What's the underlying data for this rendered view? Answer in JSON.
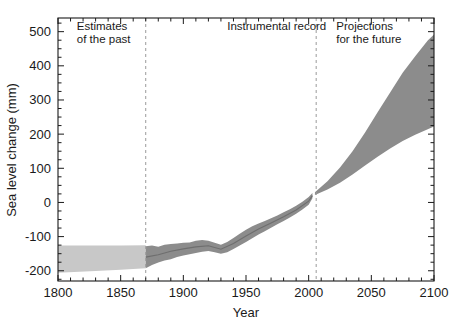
{
  "chart_data": {
    "type": "area",
    "title": "",
    "xlabel": "Year",
    "ylabel": "Sea level change (mm)",
    "xlim": [
      1800,
      2100
    ],
    "ylim": [
      -230,
      540
    ],
    "grid": false,
    "legend_position": "none",
    "xticks": [
      1800,
      1850,
      1900,
      1950,
      2000,
      2050,
      2100
    ],
    "xtick_labels": [
      "1800",
      "1850",
      "1900",
      "1950",
      "2000",
      "2050",
      "2100"
    ],
    "xminor_step": 10,
    "yticks": [
      -200,
      -100,
      0,
      100,
      200,
      300,
      400,
      500
    ],
    "ytick_labels": [
      "-200",
      "-100",
      "0",
      "100",
      "200",
      "300",
      "400",
      "500"
    ],
    "yminor_step": 25,
    "annotations": [
      {
        "name": "estimates-of-the-past",
        "lines": [
          "Estimates",
          "of the past"
        ],
        "x": 1815,
        "y": 505
      },
      {
        "name": "instrumental-record",
        "lines": [
          "Instrumental record"
        ],
        "x": 1935,
        "y": 505
      },
      {
        "name": "projections-for-the-future",
        "lines": [
          "Projections",
          "for the future"
        ],
        "x": 2022,
        "y": 505
      }
    ],
    "dividers": [
      {
        "name": "paleo-instrumental-divider",
        "x": 1870
      },
      {
        "name": "instrumental-projection-divider",
        "x": 2006
      }
    ],
    "series": [
      {
        "name": "Estimates of the past (proxy range)",
        "kind": "band",
        "color": "#c8c8c8",
        "x": [
          1800,
          1830,
          1850,
          1870
        ],
        "upper": [
          -126,
          -126,
          -126,
          -125
        ],
        "lower": [
          -206,
          -201,
          -197,
          -193
        ]
      },
      {
        "name": "Instrumental record (tide gauge range)",
        "kind": "band",
        "color": "#8c8c8c",
        "x": [
          1870,
          1875,
          1880,
          1885,
          1890,
          1895,
          1900,
          1905,
          1910,
          1915,
          1920,
          1925,
          1930,
          1935,
          1940,
          1945,
          1950,
          1955,
          1960,
          1965,
          1970,
          1975,
          1980,
          1985,
          1990,
          1995,
          2000,
          2003
        ],
        "upper": [
          -128,
          -126,
          -130,
          -124,
          -122,
          -120,
          -118,
          -117,
          -112,
          -110,
          -112,
          -118,
          -124,
          -116,
          -104,
          -92,
          -80,
          -70,
          -62,
          -54,
          -46,
          -38,
          -29,
          -20,
          -10,
          2,
          16,
          28
        ],
        "lower": [
          -193,
          -183,
          -176,
          -170,
          -166,
          -160,
          -155,
          -152,
          -148,
          -144,
          -142,
          -146,
          -150,
          -146,
          -136,
          -126,
          -116,
          -105,
          -94,
          -84,
          -74,
          -64,
          -54,
          -44,
          -33,
          -21,
          -7,
          12
        ]
      },
      {
        "name": "Instrumental record central estimate",
        "kind": "line",
        "color": "#6e6e6e",
        "x": [
          1870,
          1880,
          1890,
          1900,
          1910,
          1920,
          1930,
          1940,
          1950,
          1960,
          1970,
          1980,
          1990,
          2000,
          2003
        ],
        "y": [
          -160,
          -153,
          -143,
          -136,
          -130,
          -127,
          -137,
          -120,
          -98,
          -78,
          -60,
          -42,
          -22,
          4,
          20
        ]
      },
      {
        "name": "Projections for the future (scenario range)",
        "kind": "band",
        "color": "#8c8c8c",
        "x": [
          2005,
          2015,
          2025,
          2035,
          2045,
          2055,
          2065,
          2075,
          2085,
          2095,
          2100
        ],
        "upper": [
          30,
          62,
          102,
          150,
          205,
          264,
          322,
          380,
          428,
          474,
          492
        ],
        "lower": [
          22,
          38,
          58,
          82,
          108,
          134,
          158,
          180,
          198,
          214,
          222
        ]
      }
    ]
  },
  "figure": {
    "background_color": "#ffffff",
    "axis_color": "#1a1a1a",
    "divider_color": "#9a9a9a",
    "band_light_color": "#c8c8c8",
    "band_dark_color": "#8c8c8c"
  }
}
